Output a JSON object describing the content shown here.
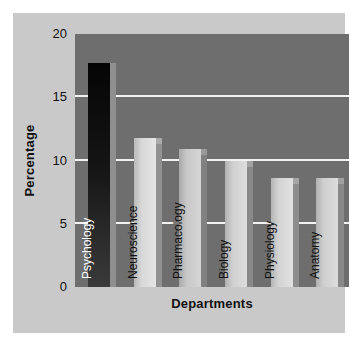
{
  "chart_data": {
    "type": "bar",
    "title": "",
    "xlabel": "Departments",
    "ylabel": "Percentage",
    "categories": [
      "Psychology",
      "Neuroscience",
      "Pharmacology",
      "Biology",
      "Physiology",
      "Anatomy"
    ],
    "values": [
      17.7,
      11.8,
      10.9,
      10.0,
      8.6,
      8.6
    ],
    "ylim": [
      0,
      20
    ],
    "yticks": [
      0,
      5,
      10,
      15,
      20
    ],
    "ytick_labels": [
      "0",
      "5",
      "10",
      "15",
      "20"
    ],
    "grid": true,
    "gridlines_at": [
      5,
      10,
      15
    ],
    "legend": "none",
    "bar_colors": [
      "#1a1a1a",
      "#d8d8d8",
      "#c8c8c8",
      "#d0d0d0",
      "#d4d4d4",
      "#cfcfcf"
    ],
    "label_colors": [
      "#ffffff",
      "#111111",
      "#111111",
      "#111111",
      "#111111",
      "#111111"
    ]
  },
  "style": {
    "figure_background": "#ffffff",
    "panel_background": "#c9c9c9",
    "plot_background": "#6e6e6e",
    "gridline_color": "#f2f2f2",
    "text_color": "#111111"
  }
}
